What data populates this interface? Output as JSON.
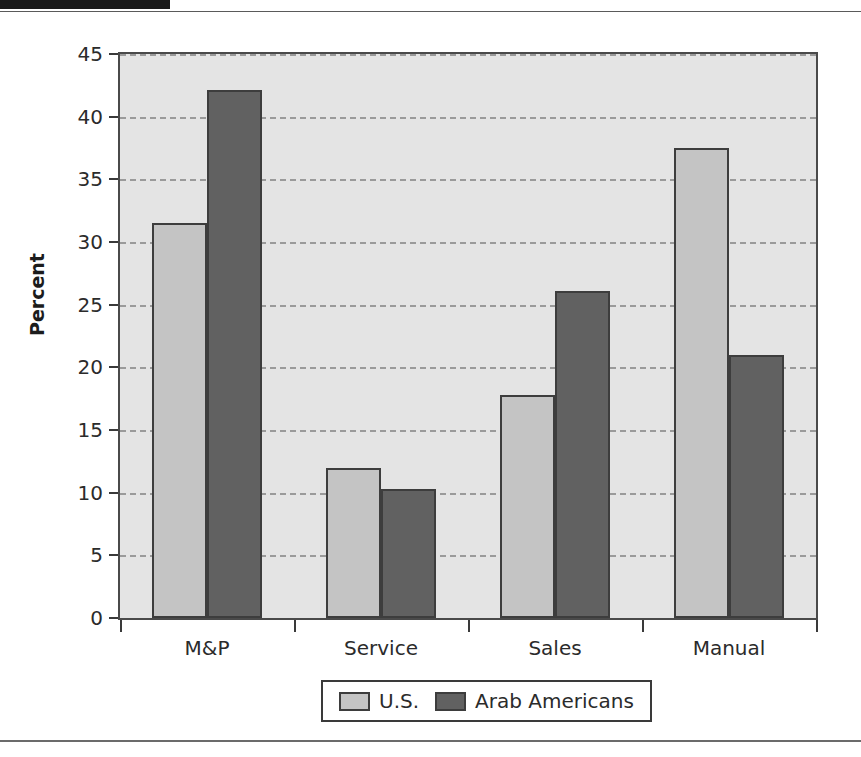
{
  "chart_data": {
    "type": "bar",
    "title": "",
    "xlabel": "",
    "ylabel": "Percent",
    "categories": [
      "M&P",
      "Service",
      "Sales",
      "Manual"
    ],
    "series": [
      {
        "name": "U.S.",
        "color": "#c4c4c4",
        "values": [
          31.5,
          12.0,
          17.8,
          37.5
        ]
      },
      {
        "name": "Arab Americans",
        "color": "#616161",
        "values": [
          42.1,
          10.3,
          26.1,
          21.0
        ]
      }
    ],
    "ylim": [
      0,
      45
    ],
    "ytick_values": [
      0,
      5,
      10,
      15,
      20,
      25,
      30,
      35,
      40,
      45
    ],
    "ytick_labels": [
      "0",
      "5",
      "10",
      "15",
      "20",
      "25",
      "30",
      "35",
      "40",
      "45"
    ],
    "grid": true,
    "grid_style": "dashed-horizontal",
    "legend_position": "bottom-center",
    "plot_background": "#e4e4e4"
  }
}
